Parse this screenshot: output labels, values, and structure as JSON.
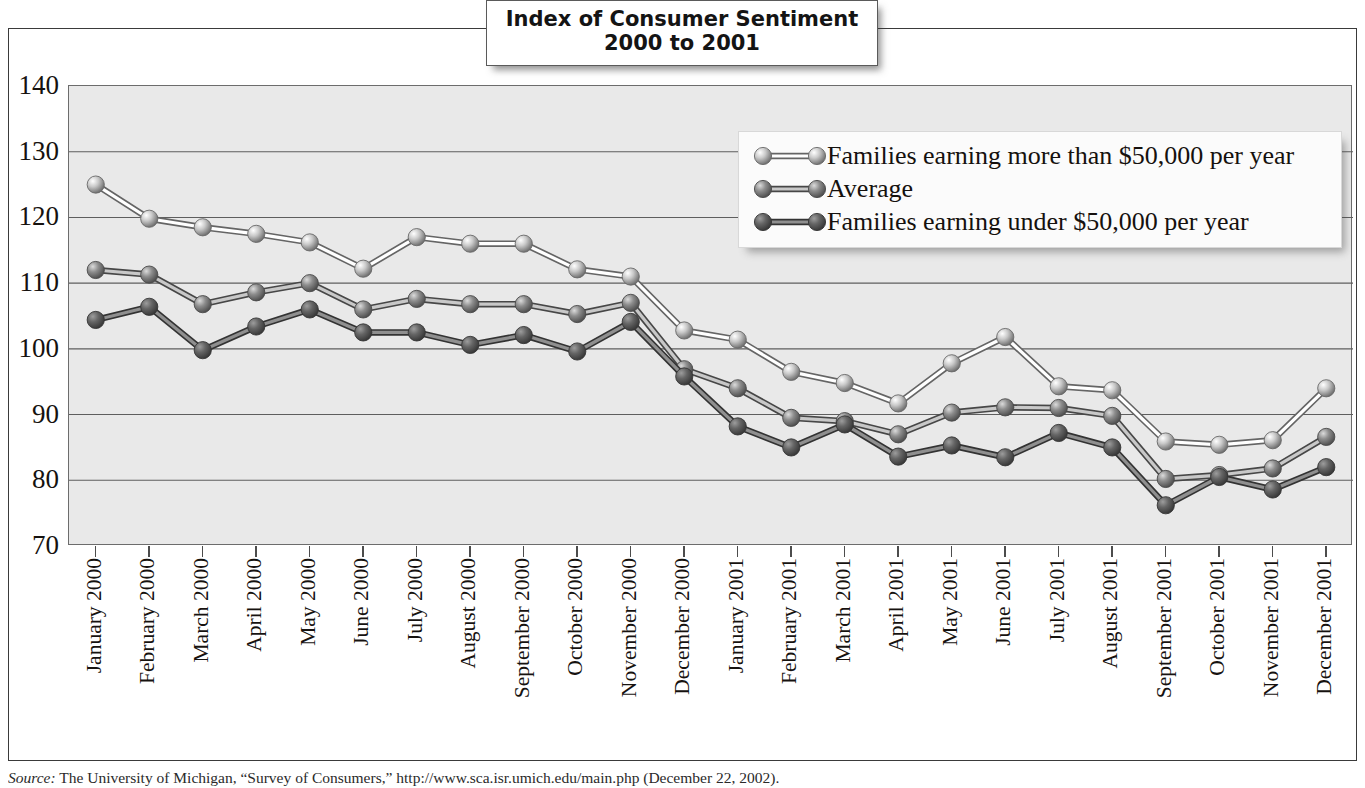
{
  "title": {
    "line1": "Index of Consumer Sentiment",
    "line2": "2000 to 2001"
  },
  "source": {
    "label": "Source:",
    "text": " The University of Michigan, “Survey of Consumers,” http://www.sca.isr.umich.edu/main.php (December 22, 2002)."
  },
  "colors": {
    "series_high": "#c9c9c9",
    "series_avg": "#8d8d8d",
    "series_low": "#656565",
    "plot_bg": "#e9e9e9",
    "gridline": "#5e5e5e",
    "frame": "#3a3a3a",
    "text": "#16120f"
  },
  "chart_data": {
    "type": "line",
    "title": "Index of Consumer Sentiment 2000 to 2001",
    "xlabel": "",
    "ylabel": "",
    "ylim": [
      70,
      140
    ],
    "yticks": [
      70,
      80,
      90,
      100,
      110,
      120,
      130,
      140
    ],
    "grid": true,
    "legend_position": "top-right",
    "categories": [
      "January 2000",
      "February 2000",
      "March 2000",
      "April 2000",
      "May 2000",
      "June 2000",
      "July 2000",
      "August 2000",
      "September 2000",
      "October 2000",
      "November 2000",
      "December 2000",
      "January 2001",
      "February 2001",
      "March 2001",
      "April 2001",
      "May 2001",
      "June 2001",
      "July 2001",
      "August 2001",
      "September 2001",
      "October 2001",
      "November 2001",
      "December 2001"
    ],
    "series": [
      {
        "name": "Families earning more than $50,000 per year",
        "color": "#c9c9c9",
        "values": [
          125.0,
          119.8,
          118.5,
          117.5,
          116.2,
          112.2,
          117.0,
          116.0,
          116.0,
          112.1,
          111.0,
          102.8,
          101.4,
          96.5,
          94.8,
          91.7,
          97.8,
          101.8,
          94.3,
          93.7,
          85.9,
          85.4,
          86.1,
          94.0
        ]
      },
      {
        "name": "Average",
        "color": "#8d8d8d",
        "values": [
          112.0,
          111.3,
          106.8,
          108.6,
          110.0,
          106.0,
          107.6,
          106.8,
          106.8,
          105.3,
          107.0,
          96.9,
          94.0,
          89.5,
          89.0,
          87.0,
          90.3,
          91.1,
          91.0,
          89.8,
          80.2,
          80.8,
          81.8,
          86.6
        ]
      },
      {
        "name": "Families earning under $50,000 per year",
        "color": "#656565",
        "values": [
          104.4,
          106.4,
          99.8,
          103.4,
          106.0,
          102.5,
          102.5,
          100.6,
          102.1,
          99.6,
          104.1,
          95.8,
          88.2,
          85.0,
          88.5,
          83.6,
          85.3,
          83.5,
          87.2,
          85.0,
          76.2,
          80.5,
          78.6,
          82.0
        ]
      }
    ]
  },
  "legend": {
    "items": [
      {
        "label": "Families earning more than $50,000 per year",
        "color": "#c9c9c9"
      },
      {
        "label": "Average",
        "color": "#8d8d8d"
      },
      {
        "label": "Families earning under $50,000 per year",
        "color": "#656565"
      }
    ]
  }
}
